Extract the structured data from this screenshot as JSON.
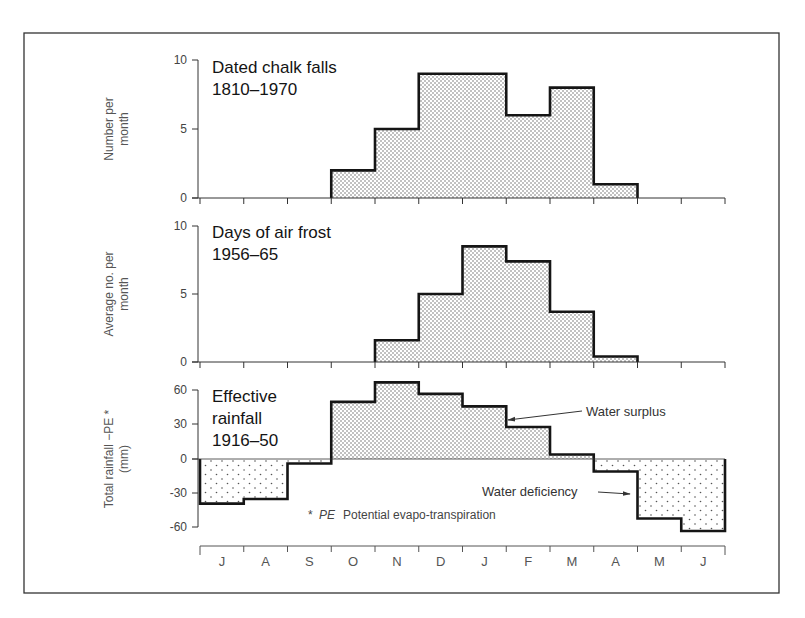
{
  "figure": {
    "frame": {
      "left": 24,
      "top": 33,
      "right": 779,
      "bottom": 593
    },
    "months": [
      "J",
      "A",
      "S",
      "O",
      "N",
      "D",
      "J",
      "F",
      "M",
      "A",
      "M",
      "J"
    ],
    "colors": {
      "ink": "#1a1a1a",
      "stipple": "#555555",
      "frame": "#333333"
    }
  },
  "chart_data": [
    {
      "type": "bar",
      "style": "step histogram, stippled fill",
      "title": "Dated chalk falls 1810–1970",
      "title_lines": [
        "Dated chalk falls",
        "1810–1970"
      ],
      "ylabel": "Number per month",
      "ylabel_lines": [
        "Number per",
        "month"
      ],
      "xlabel": "",
      "categories": [
        "J",
        "A",
        "S",
        "O",
        "N",
        "D",
        "J",
        "F",
        "M",
        "A",
        "M",
        "J"
      ],
      "values": [
        0,
        0,
        0,
        2,
        5,
        9,
        9,
        6,
        8,
        1,
        0,
        0
      ],
      "ylim": [
        0,
        10
      ],
      "yticks": [
        0,
        5,
        10
      ],
      "grid": false
    },
    {
      "type": "bar",
      "style": "step histogram, stippled fill",
      "title": "Days of air frost 1956–65",
      "title_lines": [
        "Days of air frost",
        "1956–65"
      ],
      "ylabel": "Average no. per month",
      "ylabel_lines": [
        "Average no. per",
        "month"
      ],
      "xlabel": "",
      "categories": [
        "J",
        "A",
        "S",
        "O",
        "N",
        "D",
        "J",
        "F",
        "M",
        "A",
        "M",
        "J"
      ],
      "values": [
        0,
        0,
        0,
        0,
        1.6,
        5,
        8.5,
        7.4,
        3.7,
        0.4,
        0,
        0
      ],
      "ylim": [
        0,
        10
      ],
      "yticks": [
        0,
        5,
        10
      ],
      "grid": false
    },
    {
      "type": "bar",
      "style": "step histogram, positive = dense stipple (surplus), negative = sparse stipple (deficiency)",
      "title": "Effective rainfall 1916–50",
      "title_lines": [
        "Effective",
        "rainfall",
        "1916–50"
      ],
      "ylabel": "Total rainfall −PE* (mm)",
      "ylabel_lines": [
        "Total rainfall −PE *",
        "(mm)"
      ],
      "xlabel": "",
      "categories": [
        "J",
        "A",
        "S",
        "O",
        "N",
        "D",
        "J",
        "F",
        "M",
        "A",
        "M",
        "J"
      ],
      "values": [
        -39,
        -35,
        -4,
        50,
        67,
        57,
        46,
        28,
        4,
        -11,
        -52,
        -63
      ],
      "ylim": [
        -60,
        60
      ],
      "yticks": [
        -60,
        -30,
        0,
        30,
        60
      ],
      "grid": false,
      "annotations": [
        {
          "text": "Water surplus",
          "points_to": "Jan/Feb step (positive region)"
        },
        {
          "text": "Water deficiency",
          "points_to": "May step (negative region)"
        },
        {
          "text": "* PE  Potential evapo-transpiration",
          "kind": "footnote"
        }
      ]
    }
  ],
  "labels": {
    "panel1": {
      "title1": "Dated chalk falls",
      "title2": "1810–1970",
      "ylab1": "Number per",
      "ylab2": "month",
      "t0": "0",
      "t5": "5",
      "t10": "10"
    },
    "panel2": {
      "title1": "Days of air frost",
      "title2": "1956–65",
      "ylab1": "Average no. per",
      "ylab2": "month",
      "t0": "0",
      "t5": "5",
      "t10": "10"
    },
    "panel3": {
      "title1": "Effective",
      "title2": "rainfall",
      "title3": "1916–50",
      "ylab1": "Total rainfall −PE *",
      "ylab2": "(mm)",
      "t60": "60",
      "t30": "30",
      "t0": "0",
      "tm30": "-30",
      "tm60": "-60",
      "surplus": "Water surplus",
      "deficiency": "Water deficiency",
      "note_star": "*",
      "note_pe": "PE",
      "note_text": "Potential evapo-transpiration"
    }
  }
}
